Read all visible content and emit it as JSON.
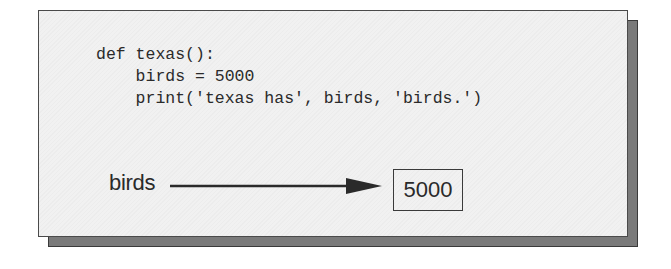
{
  "diagram": {
    "code_lines": [
      "def texas():",
      "    birds = 5000",
      "    print('texas has', birds, 'birds.')"
    ],
    "variable": {
      "name": "birds",
      "value": "5000"
    }
  }
}
